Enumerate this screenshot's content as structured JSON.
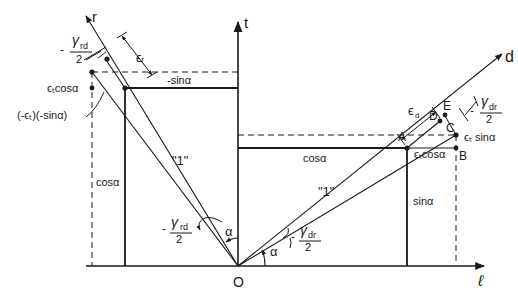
{
  "diagram": {
    "axes": {
      "t": "t",
      "r": "r",
      "d": "d",
      "l": "ℓ",
      "origin": "O"
    },
    "left_rect": {
      "top_label": "-sinα",
      "side_label": "cosα",
      "ext_label": "ϵₜcosα",
      "shift_label": "(-ϵₜ)(-sinα)",
      "strain_r": "ϵᵣ",
      "gamma_num": "γ",
      "gamma_sub": "rd",
      "gamma_den": "2",
      "gamma_sign": "-",
      "unit_label": "\"1\"",
      "angle_alpha": "α"
    },
    "right_rect": {
      "top_label": "cosα",
      "side_label": "sinα",
      "ext_cos_label": "ϵₜcosα",
      "ext_sin_label": "ϵₜ sinα",
      "strain_d": "ϵ",
      "strain_d_sub": "d",
      "gamma_num": "γ",
      "gamma_sub": "dr",
      "gamma_den": "2",
      "gamma_sign": "-",
      "unit_label": "\"1\"",
      "angle_alpha": "α"
    },
    "points": [
      "A",
      "B",
      "C",
      "D",
      "E"
    ],
    "colors": {
      "ink": "#1a1a1a",
      "background": "#ffffff"
    }
  }
}
